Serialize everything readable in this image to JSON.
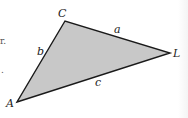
{
  "diagram": {
    "type": "triangle",
    "fill_color": "#c8c8c8",
    "stroke_color": "#1a1a1a",
    "vertices": {
      "A": {
        "label": "A",
        "x": 17,
        "y": 102
      },
      "B": {
        "label": "B",
        "x": 170,
        "y": 53
      },
      "C": {
        "label": "C",
        "x": 65,
        "y": 21
      }
    },
    "sides": {
      "a": {
        "label": "a",
        "between": [
          "B",
          "C"
        ]
      },
      "b": {
        "label": "b",
        "between": [
          "A",
          "C"
        ]
      },
      "c": {
        "label": "c",
        "between": [
          "A",
          "B"
        ]
      }
    },
    "vertex_labels": {
      "A": "A",
      "B": "L",
      "C": "C"
    },
    "side_labels": {
      "a": "a",
      "b": "b",
      "c": "c"
    },
    "margin_fragments": [
      "r.",
      "."
    ]
  }
}
